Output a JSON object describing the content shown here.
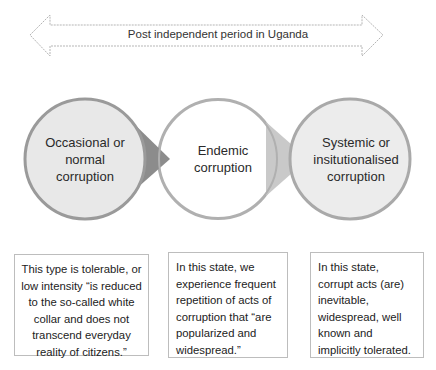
{
  "timeline": {
    "label": "Post independent period in Uganda",
    "shape": "double-headed-arrow"
  },
  "stages": [
    {
      "title_lines": [
        "Occasional or",
        "normal",
        "corruption"
      ],
      "fill": "#e8e8e8",
      "description": "This type is tolerable, or low intensity “is reduced to the so-called white collar and does not transcend everyday reality of citizens.”"
    },
    {
      "title_lines": [
        "Endemic",
        "corruption"
      ],
      "fill": "#ffffff",
      "description": "In this state, we experience frequent repetition of acts of corruption that “are popularized  and widespread.”"
    },
    {
      "title_lines": [
        "Systemic or",
        "insitutionalised",
        "corruption"
      ],
      "fill": "#ececec",
      "description": "In this state, corrupt acts (are) inevitable, widespread, well known and implicitly tolerated."
    }
  ],
  "colors": {
    "circle_border": "#a9a9a9",
    "pointer_dark": "#8c8c8c",
    "pointer_light": "#c8c8c8",
    "box_border": "#bdbdbd"
  }
}
